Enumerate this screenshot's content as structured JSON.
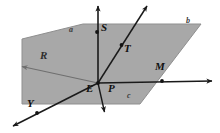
{
  "figure": {
    "background_color": "#ffffff",
    "plane_fill": "#a8a8a8",
    "plane_stroke": "#8f8f8f",
    "line_color": "#1a1a1a",
    "faint_line_color": "#6f6f6f"
  },
  "plane": {
    "name": "shaded-plane",
    "vertices": [
      [
        22,
        39
      ],
      [
        83,
        24
      ],
      [
        201,
        24
      ],
      [
        140,
        104
      ],
      [
        22,
        104
      ]
    ],
    "note": "flat quadrilateral drawn in perspective"
  },
  "points": [
    {
      "id": "S",
      "label": "S",
      "dot": [
        97,
        32
      ],
      "label_pos": [
        101,
        27
      ]
    },
    {
      "id": "T",
      "label": "T",
      "dot": [
        121,
        45
      ],
      "label_pos": [
        124,
        47
      ]
    },
    {
      "id": "M",
      "label": "M",
      "dot": [
        162,
        81
      ],
      "label_pos": [
        155,
        66
      ]
    },
    {
      "id": "E",
      "label": "E",
      "dot": [
        98,
        83
      ],
      "label_pos": [
        89,
        86
      ]
    },
    {
      "id": "Y",
      "label": "Y",
      "dot": [
        37,
        113
      ],
      "label_pos": [
        28,
        102
      ]
    },
    {
      "id": "P",
      "label": "P",
      "dot": null,
      "label_pos": [
        110,
        86
      ]
    },
    {
      "id": "R",
      "label": "R",
      "dot": null,
      "label_pos": [
        43,
        54
      ]
    }
  ],
  "plane_labels": [
    {
      "id": "a",
      "label": "a",
      "pos": [
        70,
        29
      ]
    },
    {
      "id": "b",
      "label": "b",
      "pos": [
        187,
        20
      ]
    },
    {
      "id": "c",
      "label": "c",
      "pos": [
        128,
        95
      ]
    }
  ],
  "rays": [
    {
      "id": "vertical",
      "from": [
        98,
        83
      ],
      "to": [
        98,
        3
      ],
      "arrow": true,
      "style": "solid"
    },
    {
      "id": "diagonal",
      "from": [
        98,
        83
      ],
      "to": [
        149,
        3
      ],
      "arrow": true,
      "style": "solid"
    },
    {
      "id": "horizontal",
      "from": [
        98,
        83
      ],
      "to": [
        216,
        81
      ],
      "arrow": true,
      "style": "solid"
    },
    {
      "id": "toY",
      "from": [
        98,
        83
      ],
      "to": [
        9,
        128
      ],
      "arrow": true,
      "style": "solid"
    },
    {
      "id": "toP",
      "from": [
        98,
        83
      ],
      "to": [
        105,
        115
      ],
      "arrow": true,
      "style": "solid"
    },
    {
      "id": "toR",
      "from": [
        98,
        83
      ],
      "to": [
        20,
        66
      ],
      "arrow": true,
      "style": "faint"
    }
  ]
}
